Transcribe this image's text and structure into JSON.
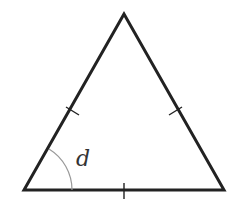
{
  "diagram": {
    "type": "equilateral-triangle",
    "vertices": {
      "apex": [
        124,
        14
      ],
      "bottom_left": [
        24,
        190
      ],
      "bottom_right": [
        224,
        190
      ]
    },
    "equal_side_marks": 3,
    "angle_label": "d",
    "angle_at": "bottom_left",
    "colors": {
      "edge": "#222222",
      "arc": "#999999",
      "label": "#333333"
    }
  }
}
